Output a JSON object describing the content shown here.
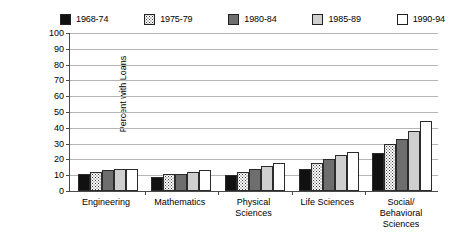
{
  "chart_data": {
    "type": "bar",
    "title": "",
    "xlabel": "",
    "ylabel": "Percent with Loans",
    "ylim": [
      0,
      100
    ],
    "ytick_step": 10,
    "yticks": [
      100,
      90,
      80,
      70,
      60,
      50,
      40,
      30,
      20,
      10,
      0
    ],
    "grid": true,
    "legend_position": "top",
    "categories": [
      "Engineering",
      "Mathematics",
      "Physical\nSciences",
      "Life Sciences",
      "Social/\nBehavioral\nSciences"
    ],
    "series": [
      {
        "name": "1968-74",
        "fill": "solid-black",
        "color": "#111111",
        "values": [
          11,
          9,
          10,
          14,
          24
        ]
      },
      {
        "name": "1975-79",
        "fill": "dotted",
        "color": "#ffffff",
        "values": [
          12,
          11,
          12,
          18,
          30
        ]
      },
      {
        "name": "1980-84",
        "fill": "dark-gray",
        "color": "#6e6e6e",
        "values": [
          13,
          11,
          14,
          20,
          33
        ]
      },
      {
        "name": "1985-89",
        "fill": "light-gray",
        "color": "#cfcfcf",
        "values": [
          14,
          12,
          16,
          23,
          38
        ]
      },
      {
        "name": "1990-94",
        "fill": "white",
        "color": "#ffffff",
        "values": [
          14,
          13,
          18,
          25,
          44
        ]
      }
    ]
  }
}
